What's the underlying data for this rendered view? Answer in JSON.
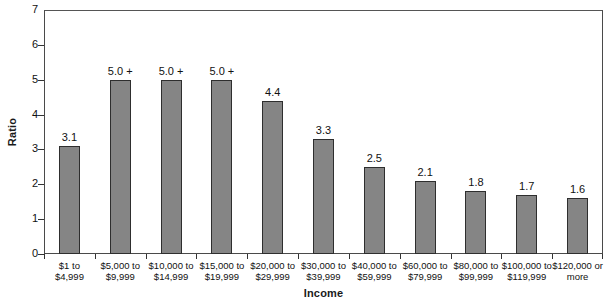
{
  "chart_data": {
    "type": "bar",
    "title": "",
    "xlabel": "Income",
    "ylabel": "Ratio",
    "ylim": [
      0,
      7
    ],
    "yticks": [
      0,
      1,
      2,
      3,
      4,
      5,
      6,
      7
    ],
    "ytick_labels": [
      "0",
      "1",
      "2",
      "3",
      "4",
      "5",
      "6",
      "7"
    ],
    "grid": false,
    "legend": null,
    "bar_color": "#858585",
    "bar_edge_color": "#2e2e2e",
    "background_color": "#ffffff",
    "frame_color": "#4a4a4a",
    "categories": [
      "$1 to\n$4,999",
      "$5,000 to\n$9,999",
      "$10,000 to\n$14,999",
      "$15,000 to\n$19,999",
      "$20,000 to\n$29,999",
      "$30,000 to\n$39,999",
      "$40,000 to\n$59,999",
      "$60,000 to\n$79,999",
      "$80,000 to\n$99,999",
      "$100,000 to\n$119,999",
      "$120,000 or\nmore"
    ],
    "values": [
      3.1,
      5.0,
      5.0,
      5.0,
      4.4,
      3.3,
      2.5,
      2.1,
      1.8,
      1.7,
      1.6
    ],
    "data_labels": [
      "3.1",
      "5.0 +",
      "5.0 +",
      "5.0 +",
      "4.4",
      "3.3",
      "2.5",
      "2.1",
      "1.8",
      "1.7",
      "1.6"
    ],
    "bars": [
      {
        "category_line1": "$1 to",
        "category_line2": "$4,999",
        "value": 3.1,
        "label": "3.1"
      },
      {
        "category_line1": "$5,000 to",
        "category_line2": "$9,999",
        "value": 5.0,
        "label": "5.0 +"
      },
      {
        "category_line1": "$10,000 to",
        "category_line2": "$14,999",
        "value": 5.0,
        "label": "5.0 +"
      },
      {
        "category_line1": "$15,000 to",
        "category_line2": "$19,999",
        "value": 5.0,
        "label": "5.0 +"
      },
      {
        "category_line1": "$20,000 to",
        "category_line2": "$29,999",
        "value": 4.4,
        "label": "4.4"
      },
      {
        "category_line1": "$30,000 to",
        "category_line2": "$39,999",
        "value": 3.3,
        "label": "3.3"
      },
      {
        "category_line1": "$40,000 to",
        "category_line2": "$59,999",
        "value": 2.5,
        "label": "2.5"
      },
      {
        "category_line1": "$60,000 to",
        "category_line2": "$79,999",
        "value": 2.1,
        "label": "2.1"
      },
      {
        "category_line1": "$80,000 to",
        "category_line2": "$99,999",
        "value": 1.8,
        "label": "1.8"
      },
      {
        "category_line1": "$100,000 to",
        "category_line2": "$119,999",
        "value": 1.7,
        "label": "1.7"
      },
      {
        "category_line1": "$120,000 or",
        "category_line2": "more",
        "value": 1.6,
        "label": "1.6"
      }
    ]
  }
}
